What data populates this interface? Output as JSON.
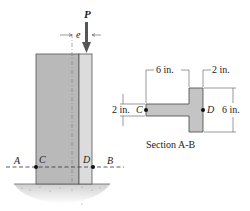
{
  "figure": {
    "type": "engineering-diagram"
  },
  "column": {
    "load_label": "P",
    "eccentricity_label": "e",
    "points": {
      "A": "A",
      "B": "B",
      "C": "C",
      "D": "D"
    },
    "colors": {
      "flange_fill": "#b9b9b9",
      "web_fill": "#dcdcdc",
      "outline": "#555555",
      "arrow": "#555555",
      "ground": "#cfcfcf"
    }
  },
  "section": {
    "caption": "Section A-B",
    "dimensions": {
      "flange_length": "6 in.",
      "web_width": "2 in.",
      "depth": "6 in.",
      "flange_thickness": "2 in."
    },
    "points": {
      "C": "C",
      "D": "D"
    },
    "colors": {
      "fill": "#c4c4c4",
      "outline": "#555555"
    }
  }
}
